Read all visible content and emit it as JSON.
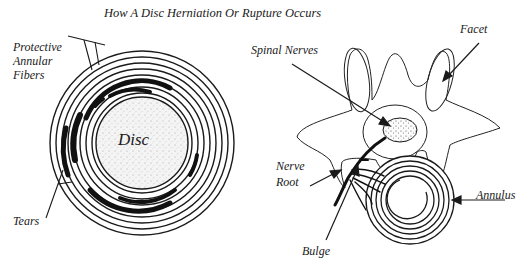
{
  "title": "How A Disc Herniation Or Rupture Occurs",
  "left_figure": {
    "center_label": "Disc",
    "labels": {
      "protective_line1": "Protective",
      "protective_line2": "Annular",
      "protective_line3": "Fibers",
      "tears": "Tears"
    }
  },
  "right_figure": {
    "labels": {
      "facet": "Facet",
      "spinal_nerves": "Spinal Nerves",
      "nerve_line1": "Nerve",
      "nerve_line2": "Root",
      "annulus": "Annulus",
      "bulge": "Bulge"
    }
  },
  "colors": {
    "ink": "#1a1a1a",
    "background": "#ffffff"
  }
}
